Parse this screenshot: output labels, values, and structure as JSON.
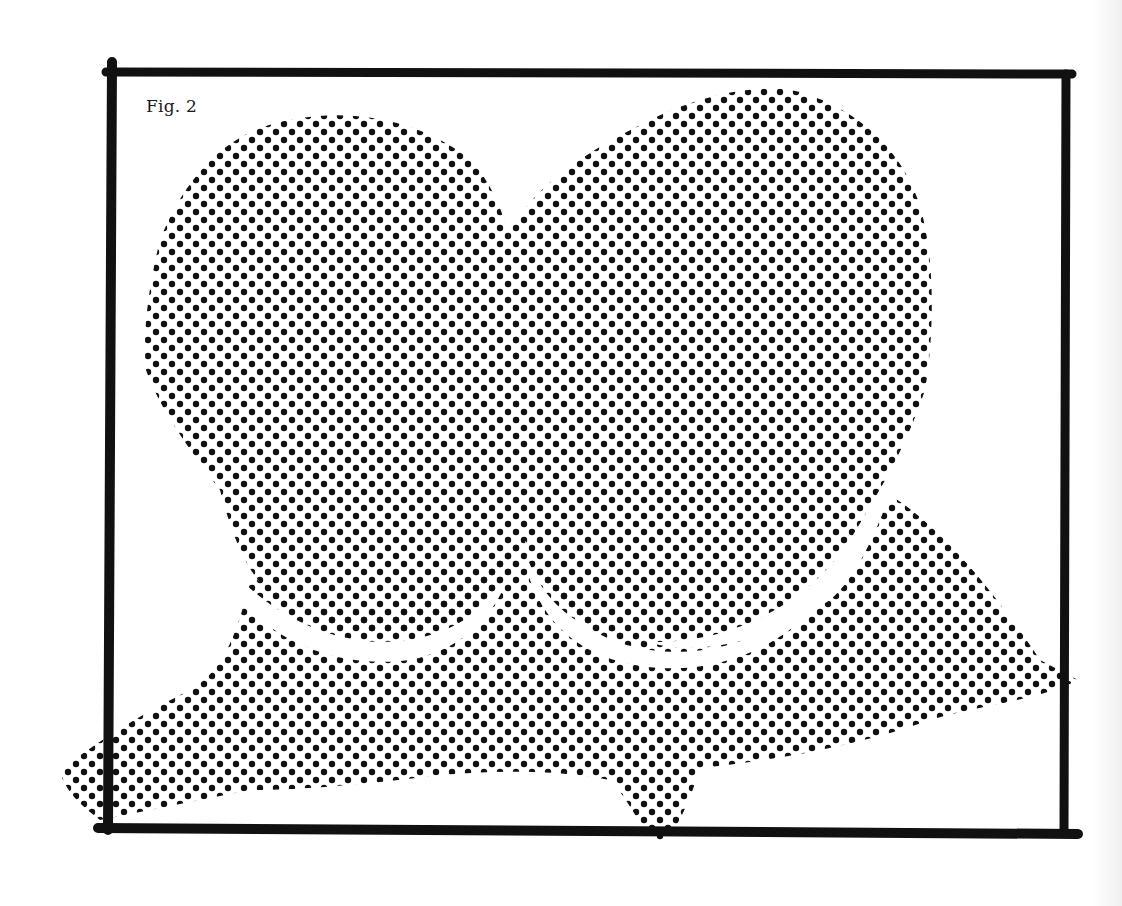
{
  "figure": {
    "label": "Fig. 2",
    "style": "halftone-dot illustration",
    "colors": {
      "ink": "#111111",
      "paper": "#ffffff"
    },
    "halftone": {
      "pitch_x": 16,
      "pitch_y": 16,
      "dot_radius": 3.2
    },
    "elements": [
      {
        "name": "frame",
        "description": "thick black rectangular border"
      },
      {
        "name": "left-lobe",
        "description": "dotted rounded lobe, left"
      },
      {
        "name": "right-lobe",
        "description": "dotted rounded lobe, right (taller)"
      },
      {
        "name": "lower-shape",
        "description": "dotted winged shape behind lobes with spike at bottom center"
      }
    ]
  }
}
